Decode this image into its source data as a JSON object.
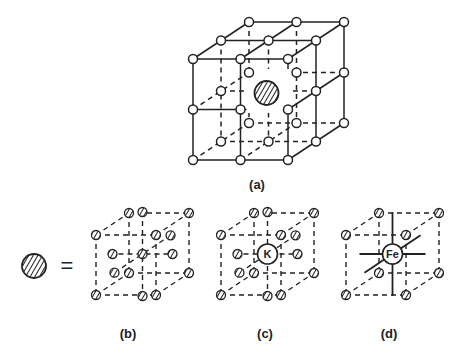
{
  "figure": {
    "panels": [
      {
        "id": "a",
        "label": "(a)",
        "center_ion": "",
        "center_style": "hatched"
      },
      {
        "id": "b",
        "label": "(b)",
        "center_ion": "",
        "center_style": "hatched"
      },
      {
        "id": "c",
        "label": "(c)",
        "center_ion": "K",
        "center_style": "open"
      },
      {
        "id": "d",
        "label": "(d)",
        "center_ion": "Fe",
        "center_style": "open"
      }
    ],
    "legend": {
      "symbol": "hatched-sphere",
      "operator": "="
    },
    "colors": {
      "ink": "#222222",
      "background": "#ffffff"
    }
  }
}
